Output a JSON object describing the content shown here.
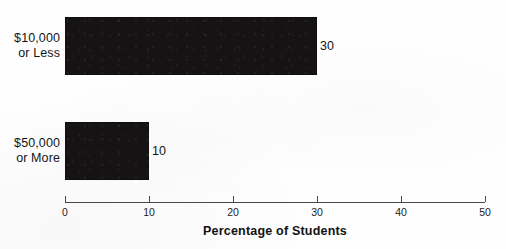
{
  "chart_data": {
    "type": "bar",
    "orientation": "horizontal",
    "title": "",
    "xlabel": "Percentage of Students",
    "ylabel": "",
    "categories": [
      "$10,000\nor Less",
      "$50,000\nor More"
    ],
    "values": [
      30,
      10
    ],
    "value_labels": [
      "30",
      "10"
    ],
    "xlim": [
      0,
      50
    ],
    "xticks": [
      0,
      10,
      20,
      30,
      40,
      50
    ],
    "xtick_labels": [
      "0",
      "10",
      "20",
      "30",
      "40",
      "50"
    ],
    "grid": false,
    "legend": null,
    "bar_color": "#151313",
    "axis_color": "#4a4a4a",
    "text_color": "#151515",
    "background": "#fefefe"
  }
}
